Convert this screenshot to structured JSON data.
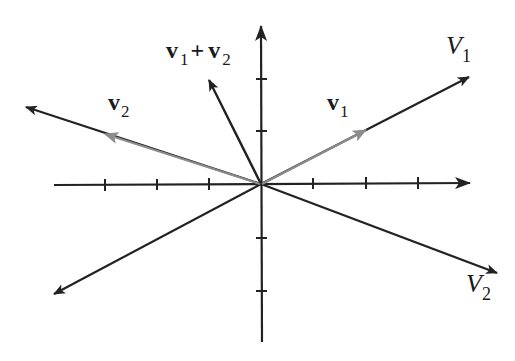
{
  "figure": {
    "type": "vector-diagram"
  },
  "colors": {
    "axis": "#222222",
    "line": "#222222",
    "vector_gray": "#8c8c8c",
    "background": "#ffffff"
  },
  "axes": {
    "origin": [
      261,
      184
    ],
    "tick_spacing_px": 52,
    "x_ticks": [
      -3,
      -2,
      -1,
      1,
      2,
      3
    ],
    "y_ticks": [
      -2,
      -1,
      1,
      2
    ]
  },
  "lines": [
    {
      "id": "V1",
      "label_main": "V",
      "label_sub": "1",
      "from": [
        261,
        184
      ],
      "to": [
        469,
        77
      ],
      "arrow": "end"
    },
    {
      "id": "V1-neg",
      "from": [
        261,
        184
      ],
      "to": [
        54,
        294
      ],
      "arrow": "end"
    },
    {
      "id": "V2",
      "label_main": "V",
      "label_sub": "2",
      "from": [
        261,
        184
      ],
      "to": [
        497,
        273
      ],
      "arrow": "end"
    },
    {
      "id": "V2-neg",
      "from": [
        261,
        184
      ],
      "to": [
        26,
        107
      ],
      "arrow": "end"
    }
  ],
  "vectors": [
    {
      "id": "v1",
      "label_main": "v",
      "label_sub": "1",
      "from": [
        261,
        184
      ],
      "to": [
        366,
        130
      ],
      "color": "gray"
    },
    {
      "id": "v2",
      "label_main": "v",
      "label_sub": "2",
      "from": [
        261,
        184
      ],
      "to": [
        105,
        134
      ],
      "color": "gray"
    },
    {
      "id": "v1+v2",
      "from": [
        261,
        184
      ],
      "to": [
        209,
        80
      ],
      "color": "black"
    }
  ],
  "labels": {
    "V1": {
      "main": "V",
      "sub": "1"
    },
    "V2": {
      "main": "V",
      "sub": "2"
    },
    "v1": {
      "main": "v",
      "sub": "1"
    },
    "v2": {
      "main": "v",
      "sub": "2"
    },
    "sum": {
      "a_main": "v",
      "a_sub": "1",
      "plus": "+",
      "b_main": "v",
      "b_sub": "2"
    }
  }
}
